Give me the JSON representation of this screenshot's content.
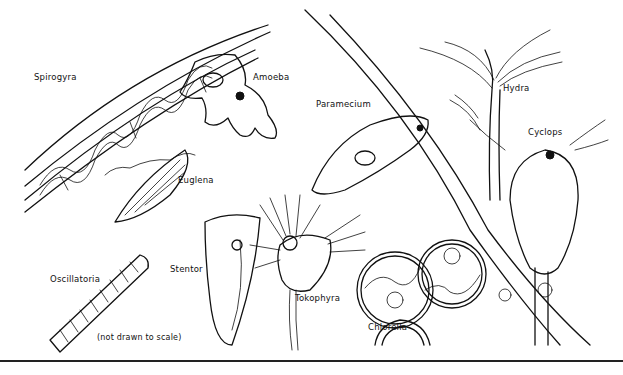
{
  "figure": {
    "note": "(not drawn to scale)",
    "labels": {
      "spirogyra": "Spirogyra",
      "amoeba": "Amoeba",
      "paramecium": "Paramecium",
      "hydra": "Hydra",
      "cyclops": "Cyclops",
      "euglena": "Euglena",
      "stentor": "Stentor",
      "oscillatoria": "Oscillatoria",
      "tokophyra": "Tokophyra",
      "chlorella": "Chlorella"
    },
    "colors": {
      "ink": "#111111",
      "background": "#ffffff"
    }
  }
}
